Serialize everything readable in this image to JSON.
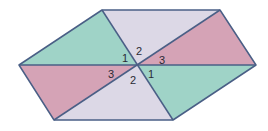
{
  "diagram": {
    "colors": {
      "teal": "#9fd3c7",
      "pink": "#d5a3b6",
      "lavender": "#dcd8e6",
      "stroke": "#4a5f86"
    },
    "vertices": {
      "top_left": [
        102,
        10
      ],
      "top_right": [
        220,
        10
      ],
      "right": [
        256,
        65
      ],
      "bottom_right": [
        173,
        120
      ],
      "bottom_left": [
        54,
        120
      ],
      "left": [
        19,
        65
      ],
      "center": [
        137,
        65
      ]
    },
    "angle_labels": [
      {
        "text": "1",
        "x": 122,
        "y": 62
      },
      {
        "text": "2",
        "x": 136,
        "y": 55
      },
      {
        "text": "3",
        "x": 159,
        "y": 64
      },
      {
        "text": "3",
        "x": 108,
        "y": 78
      },
      {
        "text": "2",
        "x": 130,
        "y": 84
      },
      {
        "text": "1",
        "x": 148,
        "y": 78
      }
    ]
  }
}
